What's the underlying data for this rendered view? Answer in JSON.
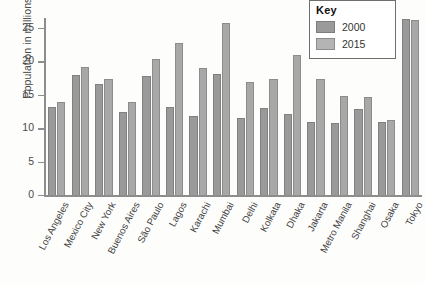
{
  "chart_data": {
    "type": "bar",
    "title": "",
    "xlabel": "",
    "ylabel": "Population in millions",
    "ylim": [
      0,
      26.5
    ],
    "yticks": [
      0,
      5,
      10,
      15,
      20,
      25
    ],
    "grid": false,
    "legend_position": "top-right",
    "legend_title": "Key",
    "categories": [
      "Los Angeles",
      "Mexico City",
      "New York",
      "Buenos Aires",
      "São Paulo",
      "Lagos",
      "Karachi",
      "Mumbai",
      "Delhi",
      "Kolkata",
      "Dhaka",
      "Jakarta",
      "Metro Manila",
      "Shanghai",
      "Osaka",
      "Tokyo"
    ],
    "series": [
      {
        "name": "2000",
        "color": "#9a9a9a",
        "values": [
          13.2,
          18.0,
          16.6,
          12.5,
          17.8,
          13.2,
          11.9,
          18.1,
          11.6,
          13.1,
          12.1,
          11.0,
          10.8,
          12.9,
          11.0,
          26.4
        ]
      },
      {
        "name": "2015",
        "color": "#b4b4b4",
        "values": [
          14.0,
          19.1,
          17.3,
          14.0,
          20.3,
          22.8,
          19.0,
          25.7,
          16.9,
          17.3,
          20.9,
          17.3,
          14.8,
          14.7,
          11.2,
          26.2
        ]
      }
    ]
  },
  "axis": {
    "y_title": "Population in millions"
  },
  "legend": {
    "title": "Key",
    "items": [
      {
        "label": "2000",
        "swatch": "swatch-2000"
      },
      {
        "label": "2015",
        "swatch": "swatch-2015"
      }
    ]
  },
  "colors": {
    "bar_2000": "#9a9a9a",
    "bar_2015": "#b4b4b4",
    "axis": "#8d8d8d",
    "text": "#3f3f3f",
    "background": "#fdfdfc"
  }
}
